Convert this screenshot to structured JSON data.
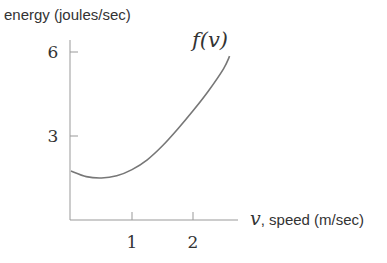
{
  "chart_data": {
    "type": "line",
    "title": "",
    "ylabel": "energy (joules/sec)",
    "xlabel_var": "v",
    "xlabel_text": ", speed (m/sec)",
    "curve_label": "f(v)",
    "x_ticks": [
      1,
      2
    ],
    "x_tick_labels": [
      "1",
      "2"
    ],
    "y_ticks": [
      3,
      6
    ],
    "y_tick_labels": [
      "3",
      "6"
    ],
    "xlim": [
      0,
      2.9
    ],
    "ylim": [
      0,
      6.3
    ],
    "grid": false,
    "legend": "none",
    "series": [
      {
        "name": "f(v)",
        "x": [
          0,
          0.25,
          0.5,
          0.75,
          1.0,
          1.25,
          1.5,
          1.75,
          2.0,
          2.25,
          2.5,
          2.6
        ],
        "y": [
          1.75,
          1.55,
          1.5,
          1.58,
          1.8,
          2.15,
          2.65,
          3.25,
          3.9,
          4.6,
          5.4,
          5.85
        ]
      }
    ]
  },
  "colors": {
    "curve": "#777777",
    "axes": "#999999",
    "text": "#333333"
  }
}
